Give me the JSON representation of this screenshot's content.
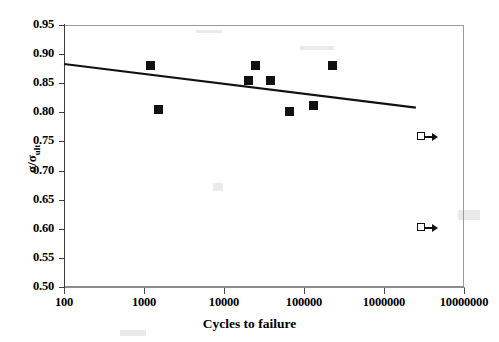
{
  "chart_data": {
    "type": "scatter",
    "title": "",
    "xlabel": "Cycles to failure",
    "ylabel": "σ/σult",
    "xscale": "log",
    "xlim": [
      100,
      10000000
    ],
    "ylim": [
      0.5,
      0.95
    ],
    "grid": false,
    "legend": false,
    "xticks": [
      100,
      1000,
      10000,
      100000,
      1000000,
      10000000
    ],
    "xtick_labels": [
      "100",
      "1000",
      "10000",
      "100000",
      "1000000",
      "10000000"
    ],
    "yticks": [
      0.5,
      0.55,
      0.6,
      0.65,
      0.7,
      0.75,
      0.8,
      0.85,
      0.9,
      0.95
    ],
    "ytick_labels": [
      "0.50",
      "0.55",
      "0.60",
      "0.65",
      "0.70",
      "0.75",
      "0.80",
      "0.85",
      "0.90",
      "0.95"
    ],
    "series": [
      {
        "name": "failed specimens",
        "marker": "filled-square",
        "points": [
          {
            "x": 1200,
            "y": 0.88
          },
          {
            "x": 1500,
            "y": 0.805
          },
          {
            "x": 20000,
            "y": 0.855
          },
          {
            "x": 25000,
            "y": 0.88
          },
          {
            "x": 38000,
            "y": 0.855
          },
          {
            "x": 65000,
            "y": 0.802
          },
          {
            "x": 130000,
            "y": 0.812
          },
          {
            "x": 230000,
            "y": 0.88
          }
        ]
      },
      {
        "name": "runout specimens",
        "marker": "open-square-arrow",
        "points": [
          {
            "x": 3000000,
            "y": 0.757
          },
          {
            "x": 3000000,
            "y": 0.602
          }
        ]
      },
      {
        "name": "trend line",
        "marker": "line",
        "points": [
          {
            "x": 100,
            "y": 0.883
          },
          {
            "x": 2500000,
            "y": 0.808
          }
        ]
      }
    ]
  },
  "axis": {
    "y_title_main": "σ/σ",
    "y_title_sub": "ult",
    "x_title": "Cycles to failure"
  }
}
